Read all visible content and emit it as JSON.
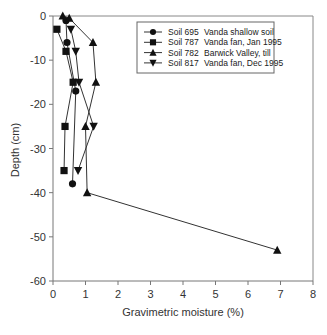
{
  "chart_data": {
    "type": "line",
    "title": "",
    "xlabel": "Gravimetric moisture (%)",
    "ylabel": "Depth (cm)",
    "xlim": [
      0,
      8
    ],
    "ylim": [
      -60,
      0
    ],
    "xticks": [
      "0",
      "1",
      "2",
      "3",
      "4",
      "5",
      "6",
      "7",
      "8"
    ],
    "yticks": [
      "0",
      "-10",
      "-20",
      "-30",
      "-40",
      "-50",
      "-60"
    ],
    "xtick_values": [
      0,
      1,
      2,
      3,
      4,
      5,
      6,
      7,
      8
    ],
    "ytick_values": [
      0,
      -10,
      -20,
      -30,
      -40,
      -50,
      -60
    ],
    "grid": false,
    "legend_position": "top-right",
    "series": [
      {
        "name": "Soil 695",
        "description": "Vanda shallow soil",
        "marker": "circle",
        "points": [
          [
            0.4,
            -1
          ],
          [
            0.43,
            -6
          ],
          [
            0.7,
            -17
          ],
          [
            0.6,
            -38
          ]
        ]
      },
      {
        "name": "Soil 787",
        "description": "Vanda fan, Jan 1995",
        "marker": "square",
        "points": [
          [
            0.12,
            -3
          ],
          [
            0.4,
            -8
          ],
          [
            0.62,
            -15
          ],
          [
            0.37,
            -25
          ],
          [
            0.34,
            -35
          ]
        ]
      },
      {
        "name": "Soil 782",
        "description": "Barwick Valley, till",
        "marker": "triangle-up",
        "points": [
          [
            0.3,
            0
          ],
          [
            0.5,
            -0.5
          ],
          [
            1.23,
            -6
          ],
          [
            1.32,
            -15
          ],
          [
            1.0,
            -25
          ],
          [
            1.05,
            -40
          ],
          [
            6.9,
            -53
          ]
        ]
      },
      {
        "name": "Soil 817",
        "description": "Vanda fan, Dec 1995",
        "marker": "triangle-down",
        "points": [
          [
            0.55,
            -3
          ],
          [
            0.7,
            -8
          ],
          [
            0.8,
            -15
          ],
          [
            1.25,
            -25
          ],
          [
            0.77,
            -35
          ]
        ]
      }
    ]
  }
}
